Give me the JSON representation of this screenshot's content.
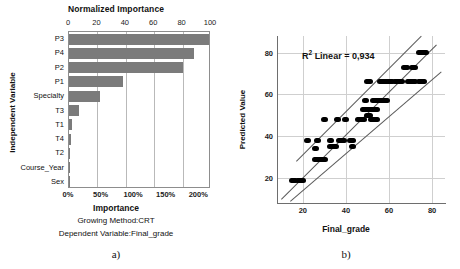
{
  "figure": {
    "panel_a_caption": "a)",
    "panel_b_caption": "b)"
  },
  "chart_data": [
    {
      "id": "importance-bar",
      "type": "bar",
      "orientation": "horizontal",
      "title": "Normalized Importance",
      "xlabel": "Importance",
      "ylabel": "Independent Variable",
      "subtitle_1": "Growing Method:CRT",
      "subtitle_2": "Dependent Variable:Final_grade",
      "categories": [
        "P3",
        "P4",
        "P2",
        "P1",
        "Specialty",
        "T3",
        "T1",
        "T4",
        "T2",
        "Course_Year",
        "Sex"
      ],
      "values_normalized": [
        100,
        88,
        80,
        38,
        22,
        7,
        2.2,
        1.3,
        1.0,
        0.6,
        0.2
      ],
      "values_importance_pct": [
        "218%",
        "192%",
        "174%",
        "83%",
        "48%",
        "15%",
        "5%",
        "3%",
        "2%",
        "1%",
        "0%"
      ],
      "top_axis_label": "Normalized Importance",
      "top_axis_ticks": [
        "0",
        "20",
        "40",
        "60",
        "80",
        "100"
      ],
      "top_axis_tick_values": [
        0,
        20,
        40,
        60,
        80,
        100
      ],
      "bottom_axis_label": "Importance",
      "bottom_axis_ticks": [
        "0%",
        "50%",
        "100%",
        "150%",
        "200%"
      ],
      "bottom_axis_tick_values": [
        0,
        50,
        100,
        150,
        200
      ],
      "xlim_normalized": [
        0,
        100
      ],
      "grid": true,
      "legend": "none",
      "bar_color": "#7b7b7b"
    },
    {
      "id": "predicted-vs-actual-scatter",
      "type": "scatter",
      "title": "",
      "xlabel": "Final_grade",
      "ylabel": "Predicted Value",
      "annotation": "R² Linear = 0,934",
      "annotation_value": "0,934",
      "xticks": [
        "20",
        "40",
        "60",
        "80"
      ],
      "xtick_values": [
        20,
        40,
        60,
        80
      ],
      "yticks": [
        "20",
        "40",
        "60",
        "80"
      ],
      "ytick_values": [
        20,
        40,
        60,
        80
      ],
      "xlim": [
        8,
        86
      ],
      "ylim": [
        8,
        88
      ],
      "grid": true,
      "legend": "none",
      "point_color": "#000000",
      "line_color": "#5a5a5a",
      "fit_lines": [
        {
          "name": "regression",
          "x1": 10,
          "y1": 10,
          "x2": 82,
          "y2": 84
        },
        {
          "name": "upper-band",
          "x1": 17,
          "y1": 28,
          "x2": 75,
          "y2": 88
        },
        {
          "name": "lower-band",
          "x1": 14,
          "y1": 9,
          "x2": 84,
          "y2": 71
        }
      ],
      "points": [
        {
          "x": 15,
          "y": 19
        },
        {
          "x": 16,
          "y": 19
        },
        {
          "x": 18,
          "y": 19
        },
        {
          "x": 19,
          "y": 19
        },
        {
          "x": 20,
          "y": 19
        },
        {
          "x": 22,
          "y": 38
        },
        {
          "x": 26,
          "y": 29
        },
        {
          "x": 27,
          "y": 29
        },
        {
          "x": 28,
          "y": 29
        },
        {
          "x": 29,
          "y": 29
        },
        {
          "x": 30,
          "y": 29
        },
        {
          "x": 26,
          "y": 34
        },
        {
          "x": 27,
          "y": 38
        },
        {
          "x": 30,
          "y": 48
        },
        {
          "x": 33,
          "y": 35
        },
        {
          "x": 34,
          "y": 35
        },
        {
          "x": 35,
          "y": 35
        },
        {
          "x": 33,
          "y": 38
        },
        {
          "x": 36,
          "y": 48
        },
        {
          "x": 37,
          "y": 38
        },
        {
          "x": 38,
          "y": 38
        },
        {
          "x": 39,
          "y": 38
        },
        {
          "x": 40,
          "y": 48
        },
        {
          "x": 42,
          "y": 38
        },
        {
          "x": 43,
          "y": 38
        },
        {
          "x": 43,
          "y": 35
        },
        {
          "x": 46,
          "y": 48
        },
        {
          "x": 47,
          "y": 48
        },
        {
          "x": 48,
          "y": 48
        },
        {
          "x": 48,
          "y": 53
        },
        {
          "x": 49,
          "y": 53
        },
        {
          "x": 50,
          "y": 53
        },
        {
          "x": 51,
          "y": 53
        },
        {
          "x": 49,
          "y": 57
        },
        {
          "x": 50,
          "y": 50
        },
        {
          "x": 51,
          "y": 50
        },
        {
          "x": 50,
          "y": 66
        },
        {
          "x": 51,
          "y": 66
        },
        {
          "x": 52,
          "y": 48
        },
        {
          "x": 53,
          "y": 48
        },
        {
          "x": 54,
          "y": 48
        },
        {
          "x": 52,
          "y": 53
        },
        {
          "x": 53,
          "y": 53
        },
        {
          "x": 54,
          "y": 53
        },
        {
          "x": 53,
          "y": 57
        },
        {
          "x": 54,
          "y": 57
        },
        {
          "x": 55,
          "y": 57
        },
        {
          "x": 56,
          "y": 57
        },
        {
          "x": 57,
          "y": 57
        },
        {
          "x": 58,
          "y": 57
        },
        {
          "x": 59,
          "y": 57
        },
        {
          "x": 56,
          "y": 66
        },
        {
          "x": 57,
          "y": 66
        },
        {
          "x": 58,
          "y": 66
        },
        {
          "x": 59,
          "y": 66
        },
        {
          "x": 60,
          "y": 66
        },
        {
          "x": 61,
          "y": 66
        },
        {
          "x": 63,
          "y": 66
        },
        {
          "x": 64,
          "y": 66
        },
        {
          "x": 65,
          "y": 66
        },
        {
          "x": 66,
          "y": 66
        },
        {
          "x": 67,
          "y": 73
        },
        {
          "x": 68,
          "y": 73
        },
        {
          "x": 69,
          "y": 66
        },
        {
          "x": 70,
          "y": 66
        },
        {
          "x": 71,
          "y": 66
        },
        {
          "x": 72,
          "y": 66
        },
        {
          "x": 71,
          "y": 73
        },
        {
          "x": 72,
          "y": 73
        },
        {
          "x": 74,
          "y": 66
        },
        {
          "x": 75,
          "y": 66
        },
        {
          "x": 76,
          "y": 66
        },
        {
          "x": 74,
          "y": 80
        },
        {
          "x": 75,
          "y": 80
        },
        {
          "x": 76,
          "y": 80
        },
        {
          "x": 77,
          "y": 80
        }
      ]
    }
  ]
}
